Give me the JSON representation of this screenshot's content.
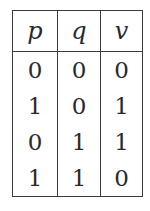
{
  "table": {
    "headers": [
      "p",
      "q",
      "v"
    ],
    "rows": [
      [
        "0",
        "0",
        "0"
      ],
      [
        "1",
        "0",
        "1"
      ],
      [
        "0",
        "1",
        "1"
      ],
      [
        "1",
        "1",
        "0"
      ]
    ]
  }
}
